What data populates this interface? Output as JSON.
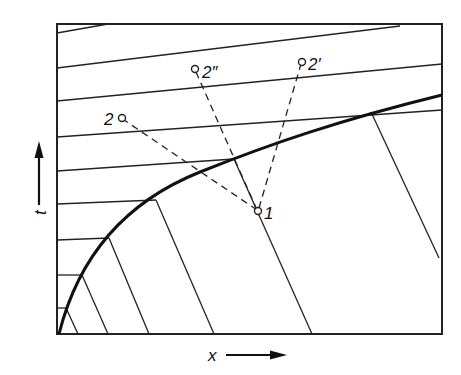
{
  "diagram": {
    "type": "characteristics-diagram",
    "axes": {
      "x_label": "x",
      "y_label": "t"
    },
    "points": [
      {
        "id": "1",
        "label": "1"
      },
      {
        "id": "2",
        "label": "2"
      },
      {
        "id": "2pp",
        "label": "2″"
      },
      {
        "id": "2p",
        "label": "2′"
      }
    ],
    "colors": {
      "ink": "#111111",
      "background": "#ffffff"
    }
  }
}
